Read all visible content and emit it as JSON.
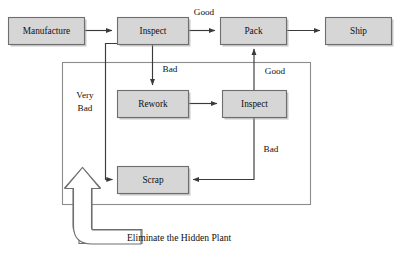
{
  "diagram": {
    "title": "Eliminate the Hidden Plant",
    "colors": {
      "node_fill": "#d6d6d6",
      "node_stroke": "#6e6e6e",
      "edge_stroke": "#3a3a3a",
      "frame_stroke": "#8c8c8c",
      "text": "#101010",
      "background": "#ffffff",
      "block_arrow_fill": "#ffffff"
    },
    "nodes": [
      {
        "id": "manufacture",
        "label": "Manufacture",
        "x": 8,
        "y": 17,
        "w": 76,
        "h": 27
      },
      {
        "id": "inspect_top",
        "label": "Inspect",
        "x": 117,
        "y": 17,
        "w": 71,
        "h": 27
      },
      {
        "id": "pack",
        "label": "Pack",
        "x": 220,
        "y": 17,
        "w": 66,
        "h": 27
      },
      {
        "id": "ship",
        "label": "Ship",
        "x": 325,
        "y": 17,
        "w": 66,
        "h": 27
      },
      {
        "id": "rework",
        "label": "Rework",
        "x": 117,
        "y": 90,
        "w": 71,
        "h": 27
      },
      {
        "id": "inspect_low",
        "label": "Inspect",
        "x": 222,
        "y": 90,
        "w": 64,
        "h": 27
      },
      {
        "id": "scrap",
        "label": "Scrap",
        "x": 117,
        "y": 166,
        "w": 71,
        "h": 27
      }
    ],
    "edge_labels": [
      {
        "id": "good_top",
        "text": "Good",
        "x": 204,
        "y": 13
      },
      {
        "id": "bad_top",
        "text": "Bad",
        "x": 169,
        "y": 70
      },
      {
        "id": "good_low",
        "text": "Good",
        "x": 274,
        "y": 72
      },
      {
        "id": "bad_low",
        "text": "Bad",
        "x": 270,
        "y": 150
      },
      {
        "id": "very_bad_1",
        "text": "Very",
        "x": 85,
        "y": 96
      },
      {
        "id": "very_bad_2",
        "text": "Bad",
        "x": 85,
        "y": 109
      }
    ],
    "caption": {
      "text": "Eliminate the Hidden Plant",
      "x": 127,
      "y": 239
    },
    "flows": [
      {
        "from": "manufacture",
        "to": "inspect_top",
        "label": ""
      },
      {
        "from": "inspect_top",
        "to": "pack",
        "label": "Good"
      },
      {
        "from": "pack",
        "to": "ship",
        "label": ""
      },
      {
        "from": "inspect_top",
        "to": "rework",
        "label": "Bad"
      },
      {
        "from": "rework",
        "to": "inspect_low",
        "label": ""
      },
      {
        "from": "inspect_low",
        "to": "pack",
        "label": "Good"
      },
      {
        "from": "inspect_low",
        "to": "scrap",
        "label": "Bad"
      },
      {
        "from": "inspect_top",
        "to": "scrap",
        "label": "Very Bad"
      }
    ]
  }
}
